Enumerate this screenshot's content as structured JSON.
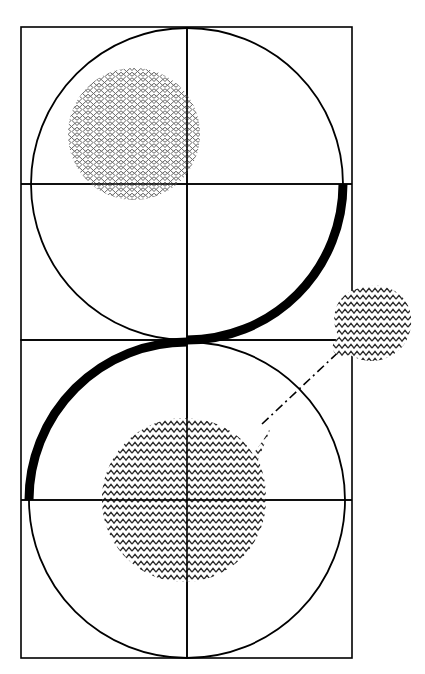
{
  "figure": {
    "title": "",
    "background_color": "#ffffff",
    "stroke_color": "#000000",
    "width": 425,
    "height": 674
  },
  "geometry": {
    "top_panel": {
      "name": "top-square",
      "x": 21,
      "y": 27,
      "width": 331,
      "height": 313,
      "stroke_width": 1.6,
      "axes": {
        "horizontal_y": 184,
        "vertical_x": 187
      },
      "circle": {
        "cx": 187,
        "cy": 184,
        "r": 156,
        "stroke_width": 1.8
      }
    },
    "bottom_panel": {
      "name": "bottom-square",
      "x": 21,
      "y": 340,
      "width": 331,
      "height": 318,
      "stroke_width": 1.6,
      "axes": {
        "horizontal_y": 500,
        "vertical_x": 187
      },
      "circle": {
        "cx": 187,
        "cy": 500,
        "r": 158,
        "stroke_width": 1.8
      }
    },
    "thick_arc": {
      "name": "thick-sweep-arc",
      "stroke_width": 9,
      "segments": [
        {
          "cx": 187,
          "cy": 184,
          "r": 156,
          "start_deg": 0,
          "end_deg": 90
        },
        {
          "cx": 187,
          "cy": 500,
          "r": 158,
          "start_deg": 270,
          "end_deg": 180
        }
      ]
    },
    "mesh_disc": {
      "name": "mesh-hatched-disc",
      "cx": 134,
      "cy": 134,
      "r": 66,
      "pattern": "net-mesh",
      "pattern_color": "#555555"
    },
    "chevron_disc": {
      "name": "chevron-hatched-disc",
      "cx": 184,
      "cy": 500,
      "r": 82,
      "tail_to": {
        "x": 268,
        "y": 420
      },
      "pattern": "chevron-zigzag",
      "pattern_color": "#2b2b2b"
    },
    "chevron_blob": {
      "name": "chevron-satellite-blob",
      "cx": 371,
      "cy": 324,
      "rx": 40,
      "ry": 38,
      "pattern": "chevron-zigzag",
      "pattern_color": "#2b2b2b"
    },
    "connector": {
      "name": "dash-dot-connector",
      "from": {
        "x": 262,
        "y": 424
      },
      "to": {
        "x": 346,
        "y": 345
      },
      "style": "dash-dot",
      "stroke_width": 1.6,
      "dash_array": "9 4 2 4"
    }
  },
  "chart_data": {
    "type": "diagram",
    "title": "",
    "xlabel": "",
    "ylabel": "",
    "elements": [
      {
        "id": "top-square",
        "shape": "rect",
        "label": "upper bounding square"
      },
      {
        "id": "top-circle",
        "shape": "circle",
        "label": "upper inscribed circle"
      },
      {
        "id": "top-axes",
        "shape": "cross",
        "label": "upper crosshair axes"
      },
      {
        "id": "mesh-disc",
        "shape": "circle",
        "label": "mesh hatched region"
      },
      {
        "id": "bottom-square",
        "shape": "rect",
        "label": "lower bounding square"
      },
      {
        "id": "bottom-circle",
        "shape": "circle",
        "label": "lower inscribed circle"
      },
      {
        "id": "bottom-axes",
        "shape": "cross",
        "label": "lower crosshair axes"
      },
      {
        "id": "chevron-disc",
        "shape": "blob",
        "label": "chevron hatched region with tail"
      },
      {
        "id": "chevron-blob",
        "shape": "blob",
        "label": "satellite chevron region"
      },
      {
        "id": "dash-dot-connector",
        "shape": "line",
        "label": "dash-dot link"
      },
      {
        "id": "thick-arc",
        "shape": "arc",
        "label": "thick S-sweep arc"
      }
    ]
  }
}
